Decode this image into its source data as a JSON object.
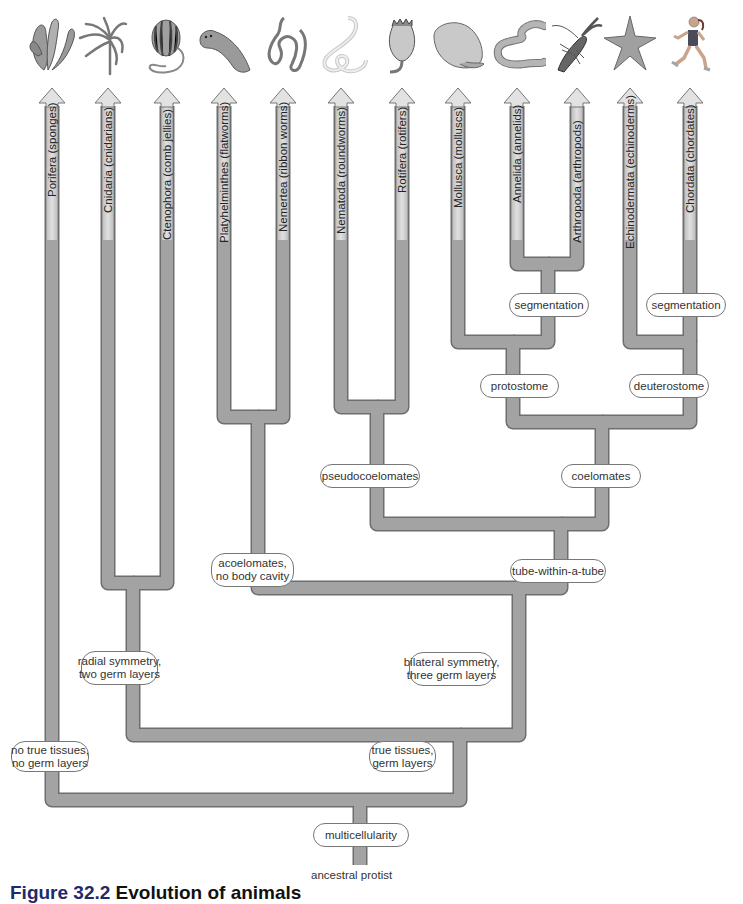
{
  "figure": {
    "caption_prefix": "Figure 32.2",
    "caption_title": "Evolution of animals"
  },
  "colors": {
    "branch_fill": "#9a9a9a",
    "branch_edge": "#6e6e6e",
    "arrow_fill": "#d6d6d6",
    "label_border": "#777777",
    "caption_accent": "#1f2a6b"
  },
  "phyla": [
    {
      "name": "Porifera (sponges)",
      "icon": "sponge-icon",
      "x": 52
    },
    {
      "name": "Cnidaria (cnidarians)",
      "icon": "hydra-icon",
      "x": 108
    },
    {
      "name": "Ctenophora (comb jellies)",
      "icon": "comb-jelly-icon",
      "x": 167
    },
    {
      "name": "Platyhelminthes (flatworms)",
      "icon": "flatworm-icon",
      "x": 224
    },
    {
      "name": "Nemertea (ribbon worms)",
      "icon": "ribbon-worm-icon",
      "x": 283
    },
    {
      "name": "Nematoda (roundworms)",
      "icon": "roundworm-icon",
      "x": 341
    },
    {
      "name": "Rotifera (rotifers)",
      "icon": "rotifer-icon",
      "x": 402
    },
    {
      "name": "Mollusca (molluscs)",
      "icon": "clam-icon",
      "x": 458
    },
    {
      "name": "Annelida (annelids)",
      "icon": "earthworm-icon",
      "x": 517
    },
    {
      "name": "Arthropoda (arthropods)",
      "icon": "crayfish-icon",
      "x": 577
    },
    {
      "name": "Echinodermata (echinoderms)",
      "icon": "sea-star-icon",
      "x": 630
    },
    {
      "name": "Chordata (chordates)",
      "icon": "human-runner-icon",
      "x": 690
    }
  ],
  "nodes": {
    "segmentation_protostome": "segmentation",
    "segmentation_deuterostome": "segmentation",
    "protostome": "protostome",
    "deuterostome": "deuterostome",
    "pseudocoelomates": "pseudocoelomates",
    "coelomates": "coelomates",
    "acoelomates_line1": "acoelomates,",
    "acoelomates_line2": "no body cavity",
    "tube_within_a_tube": "tube-within-a-tube",
    "radial_line1": "radial symmetry,",
    "radial_line2": "two germ layers",
    "bilateral_line1": "bilateral symmetry,",
    "bilateral_line2": "three germ layers",
    "no_tissues_line1": "no true tissues,",
    "no_tissues_line2": "no germ layers",
    "true_tissues_line1": "true tissues,",
    "true_tissues_line2": "germ layers",
    "multicellularity": "multicellularity"
  },
  "root": {
    "label": "ancestral protist"
  }
}
